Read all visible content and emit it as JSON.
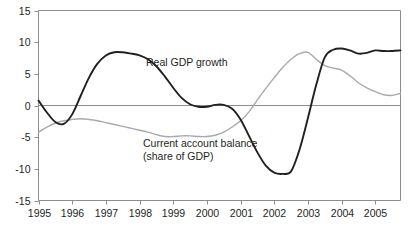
{
  "chart_data": {
    "type": "line",
    "title": "",
    "xlabel": "",
    "ylabel": "",
    "xlim": [
      1995,
      2005.75
    ],
    "ylim": [
      -15,
      15
    ],
    "yticks": [
      15,
      10,
      5,
      0,
      -5,
      -10,
      -15
    ],
    "ytick_labels": [
      "15",
      "10",
      "5",
      "0",
      "-5",
      "-10",
      "-15"
    ],
    "xticks": [
      1995,
      1996,
      1997,
      1998,
      1999,
      2000,
      2001,
      2002,
      2003,
      2004,
      2005
    ],
    "xtick_labels": [
      "1995",
      "1996",
      "1997",
      "1998",
      "1999",
      "2000",
      "2001",
      "2002",
      "2003",
      "2004",
      "2005"
    ],
    "grid": false,
    "zero_line": true,
    "legend": "inline-annotations",
    "series": [
      {
        "name": "Real GDP growth",
        "color": "#231f20",
        "width": 1.9,
        "label_x": 2000.0,
        "label_y": 5.9,
        "x": [
          1995.0,
          1995.25,
          1995.5,
          1995.75,
          1996.0,
          1996.25,
          1996.5,
          1996.75,
          1997.0,
          1997.25,
          1997.5,
          1997.75,
          1998.0,
          1998.25,
          1998.5,
          1998.75,
          1999.0,
          1999.25,
          1999.5,
          1999.75,
          2000.0,
          2000.25,
          2000.5,
          2000.75,
          2001.0,
          2001.25,
          2001.5,
          2001.75,
          2002.0,
          2002.25,
          2002.5,
          2002.75,
          2003.0,
          2003.25,
          2003.5,
          2003.75,
          2004.0,
          2004.25,
          2004.5,
          2004.75,
          2005.0,
          2005.25,
          2005.5,
          2005.75
        ],
        "y": [
          0.8,
          -1.1,
          -2.6,
          -2.9,
          -1.4,
          1.5,
          4.4,
          6.6,
          7.9,
          8.4,
          8.4,
          8.2,
          7.9,
          7.3,
          6.2,
          4.6,
          2.8,
          1.2,
          0.2,
          -0.2,
          -0.2,
          0.1,
          0.1,
          -0.5,
          -2.2,
          -4.8,
          -7.4,
          -9.5,
          -10.6,
          -10.8,
          -10.4,
          -7.0,
          -2.0,
          3.3,
          7.6,
          8.8,
          9.0,
          8.7,
          8.2,
          8.3,
          8.7,
          8.6,
          8.6,
          8.7
        ]
      },
      {
        "name": "Current account balance (share of GDP)",
        "color": "#a7a9ac",
        "width": 1.4,
        "label_x": 1998.55,
        "label_y": -5.6,
        "label_line2_y": -7.4,
        "x": [
          1995.0,
          1995.25,
          1995.5,
          1995.75,
          1996.0,
          1996.25,
          1996.5,
          1996.75,
          1997.0,
          1997.25,
          1997.5,
          1997.75,
          1998.0,
          1998.25,
          1998.5,
          1998.75,
          1999.0,
          1999.25,
          1999.5,
          1999.75,
          2000.0,
          2000.25,
          2000.5,
          2000.75,
          2001.0,
          2001.25,
          2001.5,
          2001.75,
          2002.0,
          2002.25,
          2002.5,
          2002.75,
          2003.0,
          2003.25,
          2003.5,
          2003.75,
          2004.0,
          2004.25,
          2004.5,
          2004.75,
          2005.0,
          2005.25,
          2005.5,
          2005.75
        ],
        "y": [
          -4.2,
          -3.4,
          -2.8,
          -2.4,
          -2.2,
          -2.1,
          -2.2,
          -2.4,
          -2.7,
          -3.0,
          -3.3,
          -3.6,
          -3.9,
          -4.2,
          -4.6,
          -4.9,
          -4.9,
          -4.8,
          -4.8,
          -4.9,
          -4.9,
          -4.7,
          -4.2,
          -3.4,
          -2.4,
          -1.0,
          0.9,
          2.7,
          4.4,
          6.0,
          7.3,
          8.2,
          8.4,
          7.3,
          6.3,
          5.9,
          5.6,
          4.7,
          3.6,
          2.8,
          2.2,
          1.7,
          1.6,
          1.9
        ]
      }
    ],
    "annotations": [
      {
        "text": "Real GDP growth",
        "series": "Real GDP growth"
      },
      {
        "text": "Current account balance",
        "series": "Current account balance (share of GDP)"
      },
      {
        "text": "(share of GDP)",
        "series": "Current account balance (share of GDP)"
      }
    ]
  }
}
